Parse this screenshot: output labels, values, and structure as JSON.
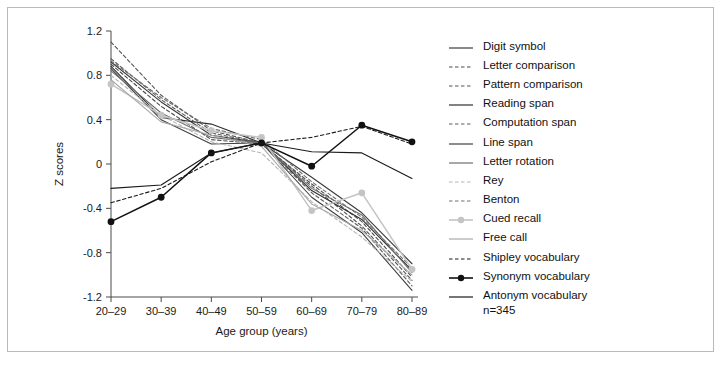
{
  "figure": {
    "n_note": "n=345"
  },
  "axes": {
    "y_label": "Z scores",
    "x_label": "Age group (years)",
    "y_ticks": [
      "1.2",
      "0.8",
      "0.4",
      "0",
      "-0.4",
      "-0.8",
      "-1.2"
    ],
    "x_ticks": [
      "20–29",
      "30–39",
      "40–49",
      "50–59",
      "60–69",
      "70–79",
      "80–89"
    ]
  },
  "legend": {
    "items": [
      {
        "label": "Digit symbol",
        "style": "solid",
        "color": "#3a3a3a",
        "marker": "none"
      },
      {
        "label": "Letter comparison",
        "style": "dashed",
        "color": "#4a4a4a",
        "marker": "none"
      },
      {
        "label": "Pattern comparison",
        "style": "dashed",
        "color": "#555555",
        "marker": "none"
      },
      {
        "label": "Reading span",
        "style": "solid",
        "color": "#2e2e2e",
        "marker": "none"
      },
      {
        "label": "Computation span",
        "style": "dashed",
        "color": "#5c5c5c",
        "marker": "none"
      },
      {
        "label": "Line span",
        "style": "solid",
        "color": "#404040",
        "marker": "none"
      },
      {
        "label": "Letter rotation",
        "style": "solid",
        "color": "#6e6e6e",
        "marker": "none"
      },
      {
        "label": "Rey",
        "style": "dashed",
        "color": "#b5b5b5",
        "marker": "none"
      },
      {
        "label": "Benton",
        "style": "dashed",
        "color": "#707070",
        "marker": "none"
      },
      {
        "label": "Cued recall",
        "style": "solid",
        "color": "#c4c4c4",
        "marker": "dot"
      },
      {
        "label": "Free call",
        "style": "solid",
        "color": "#aaaaaa",
        "marker": "none"
      },
      {
        "label": "Shipley vocabulary",
        "style": "dashed",
        "color": "#1a1a1a",
        "marker": "none"
      },
      {
        "label": "Synonym vocabulary",
        "style": "solid",
        "color": "#111111",
        "marker": "dot"
      },
      {
        "label": "Antonym vocabulary",
        "style": "solid",
        "color": "#1a1a1a",
        "marker": "none"
      }
    ]
  },
  "chart_data": {
    "type": "line",
    "title": "",
    "xlabel": "Age group (years)",
    "ylabel": "Z scores",
    "ylim": [
      -1.2,
      1.2
    ],
    "ytick_step": 0.4,
    "grid": false,
    "legend_position": "right",
    "annotation": "n=345",
    "categories": [
      "20–29",
      "30–39",
      "40–49",
      "50–59",
      "60–69",
      "70–79",
      "80–89"
    ],
    "series": [
      {
        "name": "Digit symbol",
        "style": "solid",
        "color": "#3a3a3a",
        "marker": "none",
        "values": [
          0.92,
          0.56,
          0.26,
          0.19,
          -0.12,
          -0.44,
          -0.9
        ]
      },
      {
        "name": "Letter comparison",
        "style": "dashed",
        "color": "#4a4a4a",
        "marker": "none",
        "values": [
          0.9,
          0.52,
          0.22,
          0.18,
          -0.18,
          -0.52,
          -1.02
        ]
      },
      {
        "name": "Pattern comparison",
        "style": "dashed",
        "color": "#555555",
        "marker": "none",
        "values": [
          1.1,
          0.62,
          0.3,
          0.19,
          -0.2,
          -0.56,
          -1.05
        ]
      },
      {
        "name": "Reading span",
        "style": "solid",
        "color": "#2e2e2e",
        "marker": "none",
        "values": [
          0.88,
          0.42,
          0.36,
          0.19,
          -0.24,
          -0.5,
          -0.96
        ]
      },
      {
        "name": "Computation span",
        "style": "dashed",
        "color": "#5c5c5c",
        "marker": "none",
        "values": [
          0.95,
          0.58,
          0.28,
          0.19,
          -0.26,
          -0.58,
          -1.1
        ]
      },
      {
        "name": "Line span",
        "style": "solid",
        "color": "#404040",
        "marker": "none",
        "values": [
          0.86,
          0.4,
          0.18,
          0.19,
          -0.3,
          -0.62,
          -1.14
        ]
      },
      {
        "name": "Letter rotation",
        "style": "solid",
        "color": "#6e6e6e",
        "marker": "none",
        "values": [
          0.84,
          0.46,
          0.24,
          0.19,
          -0.22,
          -0.46,
          -0.98
        ]
      },
      {
        "name": "Rey",
        "style": "dashed",
        "color": "#b5b5b5",
        "marker": "none",
        "values": [
          0.8,
          0.44,
          0.2,
          0.1,
          -0.34,
          -0.66,
          -1.06
        ]
      },
      {
        "name": "Benton",
        "style": "dashed",
        "color": "#707070",
        "marker": "none",
        "values": [
          0.93,
          0.6,
          0.32,
          0.22,
          -0.16,
          -0.48,
          -0.94
        ]
      },
      {
        "name": "Cued recall",
        "style": "solid",
        "color": "#c4c4c4",
        "marker": "dot",
        "values": [
          0.72,
          0.44,
          0.3,
          0.24,
          -0.42,
          -0.26,
          -0.95
        ]
      },
      {
        "name": "Free call",
        "style": "solid",
        "color": "#aaaaaa",
        "marker": "none",
        "values": [
          0.76,
          0.38,
          0.26,
          0.16,
          -0.36,
          -0.6,
          -1.0
        ]
      },
      {
        "name": "Shipley vocabulary",
        "style": "dashed",
        "color": "#1a1a1a",
        "marker": "none",
        "values": [
          -0.35,
          -0.22,
          0.02,
          0.19,
          0.24,
          0.34,
          0.18
        ]
      },
      {
        "name": "Synonym vocabulary",
        "style": "solid",
        "color": "#111111",
        "marker": "dot",
        "values": [
          -0.52,
          -0.3,
          0.1,
          0.19,
          -0.02,
          0.35,
          0.2
        ]
      },
      {
        "name": "Antonym vocabulary",
        "style": "solid",
        "color": "#1a1a1a",
        "marker": "none",
        "values": [
          -0.22,
          -0.19,
          0.1,
          0.19,
          0.11,
          0.1,
          -0.13
        ]
      }
    ]
  }
}
